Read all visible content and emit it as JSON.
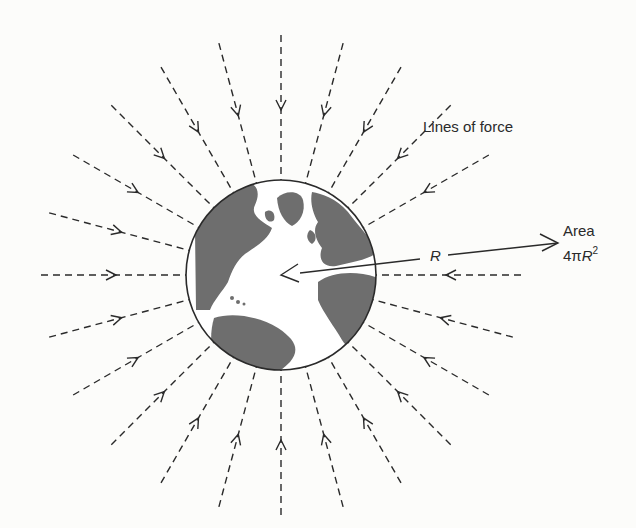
{
  "labels": {
    "lines_of_force": "Lines of force",
    "area_title": "Area",
    "area_formula_prefix": "4π",
    "area_formula_var": "R",
    "area_formula_exp": "2",
    "radius_label": "R"
  },
  "globe": {
    "center": [
      281,
      275
    ],
    "radius": 95,
    "ocean_color": "#ffffff",
    "land_color": "#6e6e6e",
    "outline_color": "#2a2a2a"
  },
  "field_lines": {
    "style": "dashed",
    "direction": "inward",
    "color": "#2a2a2a",
    "angles_deg": [
      0,
      15,
      30,
      45,
      60,
      75,
      90,
      105,
      120,
      135,
      150,
      165,
      180,
      195,
      210,
      225,
      240,
      255,
      270,
      285,
      300,
      315,
      330,
      345
    ],
    "outer_radius": 240,
    "arrow_radius": 165
  },
  "radius_arrow": {
    "from": [
      562,
      243
    ],
    "to": [
      281,
      275
    ]
  }
}
